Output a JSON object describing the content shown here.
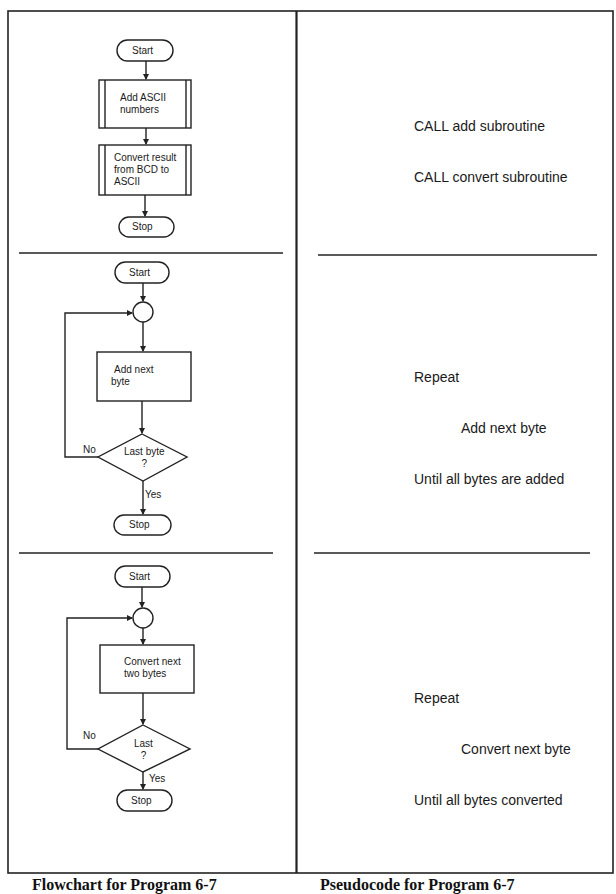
{
  "figure": {
    "captions": {
      "left": "Flowchart for Program 6-7",
      "right": "Pseudocode for Program 6-7"
    }
  },
  "panels": [
    {
      "flowchart": {
        "start": "Start",
        "steps": [
          {
            "type": "predefined-process",
            "lines": [
              "Add ASCII",
              "numbers"
            ]
          },
          {
            "type": "predefined-process",
            "lines": [
              "Convert result",
              "from  BCD to",
              "ASCII"
            ]
          }
        ],
        "stop": "Stop"
      },
      "pseudocode": {
        "lines": [
          "CALL add subroutine",
          "CALL convert subroutine"
        ]
      }
    },
    {
      "flowchart": {
        "start": "Start",
        "process": {
          "lines": [
            "Add next",
            "byte"
          ]
        },
        "decision": {
          "lines": [
            "Last byte",
            "?"
          ],
          "no_label": "No",
          "yes_label": "Yes"
        },
        "stop": "Stop"
      },
      "pseudocode": {
        "lines": [
          "Repeat",
          "Add next byte",
          "Until all bytes are added"
        ]
      }
    },
    {
      "flowchart": {
        "start": "Start",
        "process": {
          "lines": [
            "Convert next",
            "two bytes"
          ]
        },
        "decision": {
          "lines": [
            "Last",
            "?"
          ],
          "no_label": "No",
          "yes_label": "Yes"
        },
        "stop": "Stop"
      },
      "pseudocode": {
        "lines": [
          "Repeat",
          "Convert next byte",
          "Until all bytes converted"
        ]
      }
    }
  ]
}
